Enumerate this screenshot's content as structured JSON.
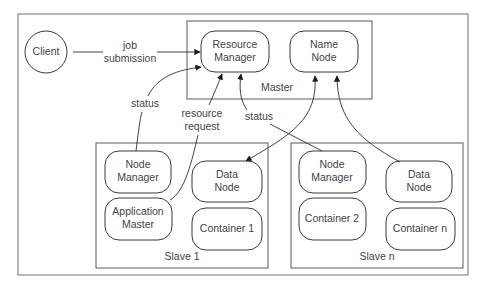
{
  "diagram": {
    "title": "",
    "client": {
      "label": "Client"
    },
    "master": {
      "label": "Master",
      "resource_manager": {
        "line1": "Resource",
        "line2": "Manager"
      },
      "name_node": {
        "line1": "Name",
        "line2": "Node"
      }
    },
    "slaves": [
      {
        "label": "Slave 1",
        "node_manager": {
          "line1": "Node",
          "line2": "Manager"
        },
        "data_node": {
          "line1": "Data",
          "line2": "Node"
        },
        "application_master": {
          "line1": "Application",
          "line2": "Master"
        },
        "container": {
          "label": "Container 1"
        }
      },
      {
        "label": "Slave n",
        "node_manager": {
          "line1": "Node",
          "line2": "Manager"
        },
        "data_node": {
          "line1": "Data",
          "line2": "Node"
        },
        "container_a": {
          "label": "Container 2"
        },
        "container_b": {
          "label": "Container n"
        }
      }
    ],
    "edges": {
      "job_submission": {
        "line1": "job",
        "line2": "submission"
      },
      "status_slave1": {
        "label": "status"
      },
      "resource_request": {
        "line1": "resource",
        "line2": "request"
      },
      "status_slaven": {
        "label": "status"
      }
    },
    "colors": {
      "background": "#ffffff",
      "stroke": "#3a3a3a",
      "text": "#444444"
    }
  }
}
